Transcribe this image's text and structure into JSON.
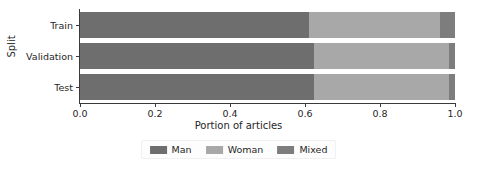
{
  "chart_data": {
    "type": "bar",
    "orientation": "horizontal",
    "stacked": true,
    "normalized": true,
    "title": "",
    "xlabel": "Portion of articles",
    "ylabel": "Split",
    "xlim": [
      0.0,
      1.0
    ],
    "grid": false,
    "legend_position": "bottom-center",
    "categories": [
      "Train",
      "Validation",
      "Test"
    ],
    "xticks": [
      0.0,
      0.2,
      0.4,
      0.6,
      0.8,
      1.0
    ],
    "xticklabels": [
      "0.0",
      "0.2",
      "0.4",
      "0.6",
      "0.8",
      "1.0"
    ],
    "series": [
      {
        "name": "Man",
        "color": "#6e6e6e",
        "values": [
          0.61,
          0.625,
          0.625
        ]
      },
      {
        "name": "Woman",
        "color": "#a8a8a8",
        "values": [
          0.35,
          0.36,
          0.36
        ]
      },
      {
        "name": "Mixed",
        "color": "#7d7d7d",
        "values": [
          0.04,
          0.015,
          0.015
        ]
      }
    ]
  },
  "legend": {
    "entries": [
      {
        "label": "Man",
        "color": "#6e6e6e"
      },
      {
        "label": "Woman",
        "color": "#a8a8a8"
      },
      {
        "label": "Mixed",
        "color": "#7d7d7d"
      }
    ]
  },
  "axes": {
    "x_title": "Portion of articles",
    "y_title": "Split"
  }
}
